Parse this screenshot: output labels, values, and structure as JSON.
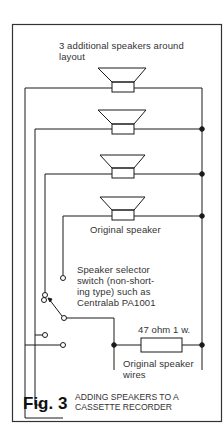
{
  "figure": {
    "number": "Fig. 3",
    "caption_line1": "ADDING SPEAKERS TO A",
    "caption_line2": "CASSETTE RECORDER"
  },
  "labels": {
    "additional_line1": "3 additional speakers around",
    "additional_line2": "layout",
    "original_speaker": "Original speaker",
    "switch_line1": "Speaker selector",
    "switch_line2": "switch (non-short-",
    "switch_line3": "ing type) such as",
    "switch_line4": "Centralab PA1001",
    "resistor": "47 ohm 1 w.",
    "wires_line1": "Original speaker",
    "wires_line2": "wires"
  },
  "components": {
    "speakers": [
      "additional-1",
      "additional-2",
      "additional-3",
      "original"
    ],
    "resistor": "47 ohm 1 w.",
    "switch": "Centralab PA1001"
  },
  "colors": {
    "line": "#1a1a1a",
    "frame": "#333333",
    "background": "#ffffff"
  }
}
